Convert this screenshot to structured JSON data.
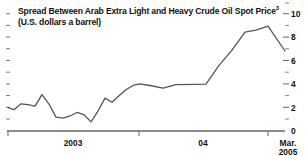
{
  "chart_data": {
    "type": "line",
    "title": "Spread Between Arab Extra Light and Heavy Crude Oil Spot Price",
    "title_footnote": "3",
    "subtitle": "(U.S. dollars a barrel)",
    "xlabel": "",
    "ylabel": "",
    "ylim": [
      0,
      10
    ],
    "y_ticks": [
      "0",
      "2",
      "4",
      "6",
      "8",
      "10"
    ],
    "y_tick_values": [
      0,
      2,
      4,
      6,
      8,
      10
    ],
    "y_minor_tick_values": [
      1,
      3,
      5,
      7,
      9
    ],
    "y_axis_position": "right",
    "grid": false,
    "legend": "none",
    "x_tick_labels": [
      "2003",
      "04",
      "Mar.\n2005"
    ],
    "x_tick_label_1": "2003",
    "x_tick_label_2": "04",
    "x_tick_label_3a": "Mar.",
    "x_tick_label_3b": "2005",
    "x_tick_positions": [
      8,
      139,
      268
    ],
    "line_color": "#555555",
    "axis_color": "#666666",
    "text_color": "#111111",
    "x": [
      0,
      1,
      2,
      3,
      4,
      5,
      6,
      7,
      8,
      9,
      10,
      11,
      12,
      13,
      14,
      15,
      16,
      17,
      18,
      19,
      20,
      21,
      22,
      23,
      24,
      25,
      26
    ],
    "values": [
      2.0,
      1.8,
      2.3,
      2.25,
      2.1,
      3.1,
      2.3,
      1.2,
      1.1,
      1.25,
      1.6,
      1.4,
      0.8,
      1.7,
      2.8,
      2.45,
      3.0,
      3.5,
      3.9,
      4.0,
      3.85,
      3.65,
      3.95,
      3.95,
      4.0,
      5.6,
      6.9
    ],
    "values_tail": [
      8.4,
      8.6,
      8.95,
      6.85
    ],
    "series": [
      {
        "name": "Arab Extra Light minus Heavy Crude Spot Price Spread",
        "points": [
          {
            "x": 8,
            "y": 2.0
          },
          {
            "x": 14,
            "y": 1.82
          },
          {
            "x": 21,
            "y": 2.32
          },
          {
            "x": 28,
            "y": 2.25
          },
          {
            "x": 35,
            "y": 2.12
          },
          {
            "x": 42,
            "y": 3.1
          },
          {
            "x": 49,
            "y": 2.3
          },
          {
            "x": 56,
            "y": 1.18
          },
          {
            "x": 63,
            "y": 1.1
          },
          {
            "x": 70,
            "y": 1.28
          },
          {
            "x": 77,
            "y": 1.58
          },
          {
            "x": 84,
            "y": 1.38
          },
          {
            "x": 91,
            "y": 0.78
          },
          {
            "x": 98,
            "y": 1.7
          },
          {
            "x": 105,
            "y": 2.8
          },
          {
            "x": 112,
            "y": 2.45
          },
          {
            "x": 119,
            "y": 3.0
          },
          {
            "x": 126,
            "y": 3.52
          },
          {
            "x": 133,
            "y": 3.88
          },
          {
            "x": 140,
            "y": 4.02
          },
          {
            "x": 150,
            "y": 3.88
          },
          {
            "x": 163,
            "y": 3.66
          },
          {
            "x": 176,
            "y": 3.96
          },
          {
            "x": 196,
            "y": 3.98
          },
          {
            "x": 206,
            "y": 4.0
          },
          {
            "x": 219,
            "y": 5.6
          },
          {
            "x": 232,
            "y": 6.9
          },
          {
            "x": 245,
            "y": 8.42
          },
          {
            "x": 256,
            "y": 8.6
          },
          {
            "x": 268,
            "y": 8.95
          },
          {
            "x": 285,
            "y": 6.82
          }
        ]
      }
    ]
  }
}
